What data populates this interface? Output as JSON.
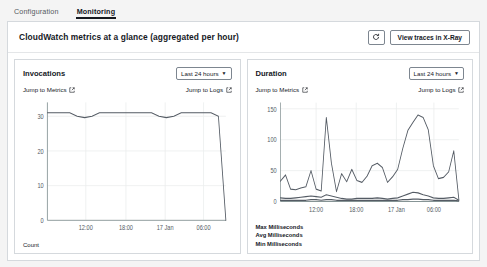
{
  "tabs": [
    {
      "label": "Configuration",
      "active": false
    },
    {
      "label": "Monitoring",
      "active": true
    }
  ],
  "panel": {
    "title": "CloudWatch metrics at a glance (aggregated per hour)",
    "refresh_icon": "refresh-icon",
    "view_traces_label": "View traces in X-Ray"
  },
  "cards": [
    {
      "title": "Invocations",
      "range_label": "Last 24 hours",
      "caret_icon": "chevron-down-icon",
      "jump_metrics_label": "Jump to Metrics",
      "jump_logs_label": "Jump to Logs",
      "external_icon": "external-link-icon",
      "axis_label": "Count"
    },
    {
      "title": "Duration",
      "range_label": "Last 24 hours",
      "caret_icon": "chevron-down-icon",
      "jump_metrics_label": "Jump to Metrics",
      "jump_logs_label": "Jump to Logs",
      "external_icon": "external-link-icon",
      "legend": [
        "Max Milliseconds",
        "Avg Milliseconds",
        "Min Milliseconds"
      ]
    }
  ],
  "chart_data": [
    {
      "type": "line",
      "title": "Invocations",
      "xlabel": "",
      "ylabel": "Count",
      "ylim": [
        0,
        34
      ],
      "yticks": [
        0,
        10,
        20,
        30
      ],
      "ytick_labels": [
        "0",
        "10",
        "20",
        "30"
      ],
      "xtick_labels": [
        "12:00",
        "18:00",
        "17 Jan",
        "06:00"
      ],
      "xtick_positions": [
        0.215,
        0.44,
        0.66,
        0.875
      ],
      "grid": true,
      "legend_position": "none",
      "line_color": "#545b64",
      "x": [
        0,
        1,
        2,
        3,
        4,
        5,
        6,
        7,
        8,
        9,
        10,
        11,
        12,
        13,
        14,
        15,
        16,
        17,
        18,
        19,
        20,
        21,
        22,
        23,
        24
      ],
      "series": [
        {
          "name": "Count",
          "values": [
            31,
            31,
            31,
            31,
            30,
            29.6,
            30,
            31,
            31,
            31,
            31,
            31,
            31,
            31,
            31,
            30,
            29.6,
            30,
            31,
            31,
            31,
            31,
            31,
            30,
            0
          ]
        }
      ]
    },
    {
      "type": "line",
      "title": "Duration",
      "xlabel": "",
      "ylabel": "Milliseconds",
      "ylim": [
        0,
        160
      ],
      "yticks": [
        0,
        50,
        100,
        150
      ],
      "ytick_labels": [
        "0",
        "50",
        "100",
        "150"
      ],
      "xtick_labels": [
        "12:00",
        "18:00",
        "17 Jan",
        "06:00"
      ],
      "xtick_positions": [
        0.2,
        0.425,
        0.65,
        0.86
      ],
      "grid": true,
      "legend_position": "below",
      "line_color": "#545b64",
      "x": [
        0,
        1,
        2,
        3,
        4,
        5,
        6,
        7,
        8,
        9,
        10,
        11,
        12,
        13,
        14,
        15,
        16,
        17,
        18,
        19,
        20,
        21,
        22,
        23,
        24,
        25,
        26,
        27,
        28,
        29,
        30,
        31,
        32,
        33,
        34,
        35
      ],
      "series": [
        {
          "name": "Max Milliseconds",
          "values": [
            33,
            43,
            20,
            19,
            22,
            24,
            50,
            20,
            17,
            136,
            62,
            16,
            45,
            32,
            52,
            34,
            31,
            41,
            58,
            62,
            55,
            31,
            40,
            52,
            86,
            115,
            128,
            140,
            136,
            116,
            58,
            37,
            39,
            48,
            82,
            3
          ]
        },
        {
          "name": "Avg Milliseconds",
          "values": [
            6,
            5,
            5,
            6,
            7,
            8,
            9,
            8,
            7,
            11,
            9,
            7,
            5,
            4,
            4,
            5,
            5,
            5,
            5,
            6,
            5,
            4,
            5,
            6,
            9,
            12,
            15,
            14,
            11,
            9,
            6,
            5,
            5,
            6,
            7,
            2
          ]
        },
        {
          "name": "Min Milliseconds",
          "values": [
            2,
            2,
            2,
            2,
            2,
            2,
            3,
            3,
            2,
            3,
            3,
            2,
            2,
            2,
            2,
            2,
            2,
            2,
            2,
            2,
            2,
            2,
            2,
            2,
            3,
            3,
            4,
            4,
            3,
            3,
            2,
            2,
            2,
            2,
            2,
            1
          ]
        }
      ]
    }
  ]
}
